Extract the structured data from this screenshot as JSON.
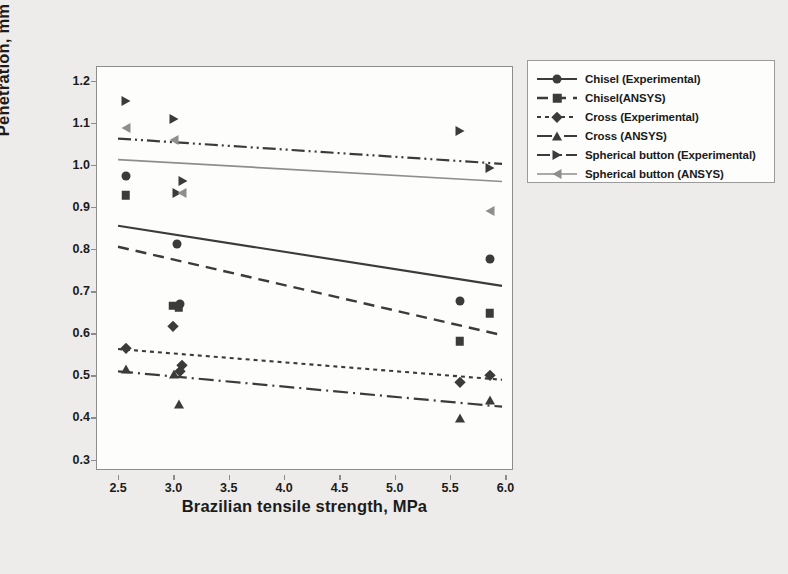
{
  "chart_data": {
    "type": "scatter",
    "title": "",
    "xlabel": "Brazilian tensile strength, MPa",
    "ylabel": "Penetration, mm",
    "xlim": [
      2.3,
      6.05
    ],
    "ylim": [
      0.28,
      1.235
    ],
    "xticks": [
      "2.5",
      "3.0",
      "3.5",
      "4.0",
      "4.5",
      "5.0",
      "5.5",
      "6.0"
    ],
    "xtick_values": [
      2.5,
      3.0,
      3.5,
      4.0,
      4.5,
      5.0,
      5.5,
      6.0
    ],
    "yticks": [
      "1.2",
      "1.1",
      "1.0",
      "0.9",
      "0.8",
      "0.7",
      "0.6",
      "0.5",
      "0.4",
      "0.3"
    ],
    "ytick_values": [
      1.2,
      1.1,
      1.0,
      0.9,
      0.8,
      0.7,
      0.6,
      0.5,
      0.4,
      0.3
    ],
    "grid": false,
    "legend_position": "outside-right-top",
    "series": [
      {
        "name": "Chisel (Experimental)",
        "marker": "circle",
        "line": "solid",
        "color": "#3b3b3b",
        "points": [
          {
            "x": 2.56,
            "y": 0.975
          },
          {
            "x": 3.02,
            "y": 0.815
          },
          {
            "x": 3.05,
            "y": 0.672
          },
          {
            "x": 5.58,
            "y": 0.68
          },
          {
            "x": 5.85,
            "y": 0.778
          }
        ],
        "fit": {
          "x1": 2.49,
          "y1": 0.858,
          "x2": 5.96,
          "y2": 0.715
        }
      },
      {
        "name": "Chisel(ANSYS)",
        "marker": "square",
        "line": "dashed",
        "color": "#3b3b3b",
        "points": [
          {
            "x": 2.56,
            "y": 0.93
          },
          {
            "x": 2.99,
            "y": 0.668
          },
          {
            "x": 3.04,
            "y": 0.663
          },
          {
            "x": 5.58,
            "y": 0.583
          },
          {
            "x": 5.85,
            "y": 0.65
          }
        ],
        "fit": {
          "x1": 2.49,
          "y1": 0.808,
          "x2": 5.96,
          "y2": 0.598
        }
      },
      {
        "name": "Cross (Experimental)",
        "marker": "diamond",
        "line": "dotted",
        "color": "#3b3b3b",
        "points": [
          {
            "x": 2.56,
            "y": 0.568
          },
          {
            "x": 2.99,
            "y": 0.62
          },
          {
            "x": 3.07,
            "y": 0.528
          },
          {
            "x": 3.05,
            "y": 0.512
          },
          {
            "x": 5.58,
            "y": 0.487
          },
          {
            "x": 5.85,
            "y": 0.503
          }
        ],
        "fit": {
          "x1": 2.49,
          "y1": 0.565,
          "x2": 5.96,
          "y2": 0.492
        }
      },
      {
        "name": "Cross (ANSYS)",
        "marker": "triangle-up",
        "line": "dash-dot",
        "color": "#3b3b3b",
        "points": [
          {
            "x": 2.56,
            "y": 0.518
          },
          {
            "x": 3.0,
            "y": 0.505
          },
          {
            "x": 3.04,
            "y": 0.435
          },
          {
            "x": 5.58,
            "y": 0.402
          },
          {
            "x": 5.85,
            "y": 0.443
          }
        ],
        "fit": {
          "x1": 2.49,
          "y1": 0.512,
          "x2": 5.96,
          "y2": 0.428
        }
      },
      {
        "name": "Spherical button (Experimental)",
        "marker": "triangle-right",
        "line": "dash-dot-dot",
        "color": "#3b3b3b",
        "points": [
          {
            "x": 2.56,
            "y": 1.155
          },
          {
            "x": 3.0,
            "y": 1.112
          },
          {
            "x": 3.08,
            "y": 0.965
          },
          {
            "x": 3.02,
            "y": 0.935
          },
          {
            "x": 5.58,
            "y": 1.082
          },
          {
            "x": 5.85,
            "y": 0.995
          }
        ],
        "fit": {
          "x1": 2.49,
          "y1": 1.065,
          "x2": 5.96,
          "y2": 1.005
        }
      },
      {
        "name": "Spherical button (ANSYS)",
        "marker": "triangle-left",
        "line": "solid-gray",
        "color": "#8e8e8e",
        "points": [
          {
            "x": 2.56,
            "y": 1.09
          },
          {
            "x": 3.0,
            "y": 1.062
          },
          {
            "x": 3.07,
            "y": 0.935
          },
          {
            "x": 5.85,
            "y": 0.893
          }
        ],
        "fit": {
          "x1": 2.49,
          "y1": 1.015,
          "x2": 5.96,
          "y2": 0.963
        }
      }
    ]
  },
  "legend": {
    "items": [
      {
        "label": "Chisel (Experimental)"
      },
      {
        "label": "Chisel(ANSYS)"
      },
      {
        "label": "Cross (Experimental)"
      },
      {
        "label": "Cross (ANSYS)"
      },
      {
        "label": "Spherical button (Experimental)"
      },
      {
        "label": "Spherical button (ANSYS)"
      }
    ]
  },
  "colors": {
    "background": "#edecea",
    "plot_background": "#fdfdfc",
    "axis": "#8c8c8c",
    "dark_series": "#3b3b3b",
    "gray_series": "#8e8e8e",
    "text": "#1b1b1b"
  }
}
